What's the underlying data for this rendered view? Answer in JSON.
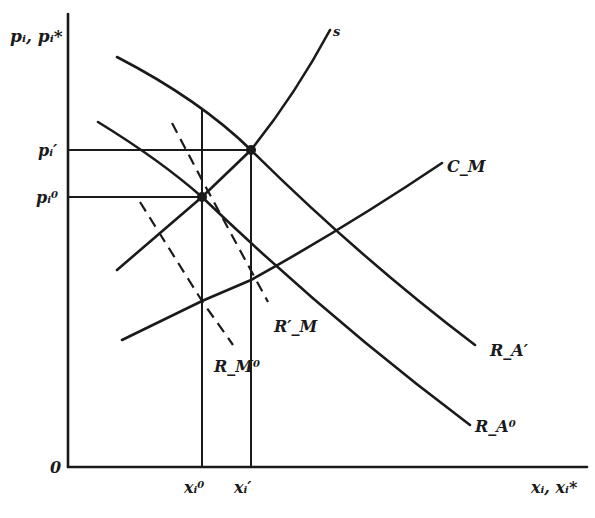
{
  "axes": {
    "y_label": "pᵢ, pᵢ*",
    "x_label": "xᵢ, xᵢ*",
    "origin": "0",
    "y_ticks": [
      {
        "label": "pᵢ′",
        "name": "p-i-prime"
      },
      {
        "label": "pᵢ⁰",
        "name": "p-i-zero"
      }
    ],
    "x_ticks": [
      {
        "label": "xᵢ⁰",
        "name": "x-i-zero"
      },
      {
        "label": "xᵢ′",
        "name": "x-i-prime"
      }
    ]
  },
  "curves": {
    "supply": "s",
    "cost_m": "C_M",
    "ra_prime": "R_A′",
    "ra_zero": "R_A⁰",
    "rm_prime": "R′_M",
    "rm_zero": "R_M⁰"
  },
  "colors": {
    "ink": "#1a1a1a",
    "paper": "#ffffff"
  }
}
